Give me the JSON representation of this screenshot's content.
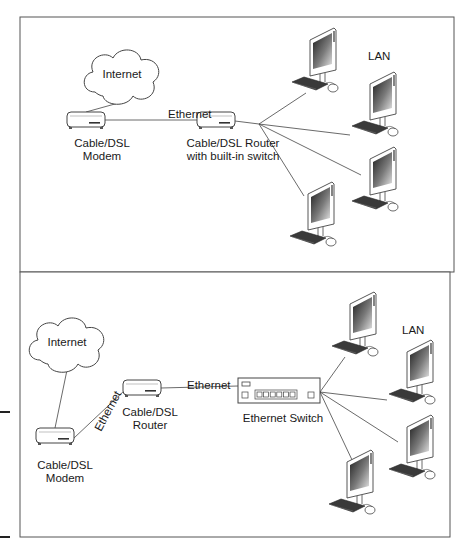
{
  "figure": {
    "panels": [
      {
        "id": "top",
        "title": "Router with built-in switch topology",
        "box": {
          "x": 20,
          "y": 17,
          "w": 434,
          "h": 255
        },
        "cloud": {
          "label": "Internet",
          "x": 85,
          "y": 50
        },
        "modem": {
          "x": 67,
          "y": 112,
          "label_line1": "Cable/DSL",
          "label_line2": "Modem",
          "label_x": 102,
          "label_y": 147
        },
        "router": {
          "x": 197,
          "y": 112,
          "label_line1": "Cable/DSL Router",
          "label_line2": "with built-in switch",
          "label_x": 233,
          "label_y": 147
        },
        "link_label": {
          "text": "Ethernet",
          "x": 168,
          "y": 118
        },
        "lan_label": {
          "text": "LAN",
          "x": 368,
          "y": 60
        },
        "hub_point": {
          "x": 259,
          "y": 124
        },
        "computers": [
          {
            "x": 300,
            "y": 28,
            "link_x": 306,
            "link_y": 93
          },
          {
            "x": 360,
            "y": 72,
            "link_x": 350,
            "link_y": 135
          },
          {
            "x": 360,
            "y": 147,
            "link_x": 361,
            "link_y": 175
          },
          {
            "x": 298,
            "y": 182,
            "link_x": 304,
            "link_y": 196
          }
        ]
      },
      {
        "id": "bottom",
        "title": "Separate router and Ethernet switch topology",
        "box": {
          "x": 20,
          "y": 272,
          "w": 430,
          "h": 265
        },
        "cloud": {
          "label": "Internet",
          "x": 30,
          "y": 318
        },
        "modem": {
          "x": 36,
          "y": 428,
          "label_line1": "Cable/DSL",
          "label_line2": "Modem",
          "label_x": 65,
          "label_y": 469
        },
        "router": {
          "x": 123,
          "y": 380,
          "label_line1": "Cable/DSL",
          "label_line2": "Router",
          "label_x": 150,
          "label_y": 416
        },
        "diag_link_label": {
          "text": "Ethernet",
          "x": 101,
          "y": 432,
          "rotate": -62
        },
        "link_label": {
          "text": "Ethernet",
          "x": 187,
          "y": 389
        },
        "switch": {
          "x": 238,
          "y": 378,
          "w": 82,
          "h": 25,
          "label": "Ethernet Switch",
          "label_x": 283,
          "label_y": 422,
          "ports": 6
        },
        "lan_label": {
          "text": "LAN",
          "x": 402,
          "y": 334
        },
        "hub_point": {
          "x": 320,
          "y": 392
        },
        "computers": [
          {
            "x": 340,
            "y": 292,
            "link_x": 345,
            "link_y": 357
          },
          {
            "x": 397,
            "y": 340,
            "link_x": 387,
            "link_y": 400
          },
          {
            "x": 397,
            "y": 415,
            "link_x": 398,
            "link_y": 442
          },
          {
            "x": 337,
            "y": 450,
            "link_x": 353,
            "link_y": 462
          }
        ]
      }
    ],
    "margin_marks": [
      {
        "x": 0,
        "y": 411,
        "w": 10
      },
      {
        "x": 0,
        "y": 536,
        "w": 10
      }
    ],
    "colors": {
      "line": "#444444",
      "panel_border": "#555555",
      "screen_dark": "#2a2a2a",
      "screen_light": "#cfcfcf",
      "keyboard": "#3a3a3a"
    }
  }
}
